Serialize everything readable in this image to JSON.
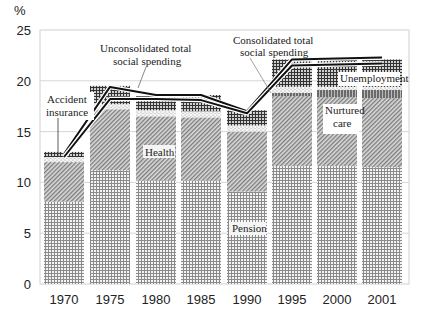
{
  "chart_data": {
    "type": "bar",
    "stacked": true,
    "title": "",
    "ylabel": "%",
    "xlabel": "",
    "ylim": [
      0,
      25
    ],
    "yticks": [
      0,
      5,
      10,
      15,
      20,
      25
    ],
    "grid": "horizontal",
    "categories": [
      "1970",
      "1975",
      "1980",
      "1985",
      "1990",
      "1995",
      "2000",
      "2001"
    ],
    "series": [
      {
        "name": "Pension",
        "pattern": "dense-grid",
        "values": [
          8.1,
          11.2,
          10.2,
          10.2,
          9.1,
          11.6,
          11.6,
          11.5
        ]
      },
      {
        "name": "Health",
        "pattern": "diagonal-hatch",
        "values": [
          3.9,
          6.0,
          6.3,
          6.2,
          5.9,
          6.9,
          6.8,
          6.8
        ]
      },
      {
        "name": "Nurtured care",
        "pattern": "dark-band",
        "values": [
          0,
          0,
          0,
          0,
          0,
          0.3,
          0.7,
          0.8
        ]
      },
      {
        "name": "Accident insurance",
        "pattern": "dots",
        "values": [
          0.5,
          0.5,
          0.6,
          0.6,
          0.6,
          0.6,
          0.3,
          0.3
        ]
      },
      {
        "name": "Unemployment",
        "pattern": "cross-hatch",
        "values": [
          0.5,
          1.8,
          1.4,
          1.6,
          1.5,
          2.7,
          2.7,
          2.7
        ]
      }
    ],
    "lines": [
      {
        "name": "Unconsolidated total social spending",
        "values": [
          12.8,
          19.4,
          18.6,
          18.6,
          17.0,
          22.1,
          22.2,
          22.3
        ]
      },
      {
        "name": "Consolidated total social spending",
        "values": [
          12.5,
          18.2,
          18.2,
          18.1,
          16.8,
          21.5,
          21.6,
          21.7
        ]
      }
    ],
    "annotations": [
      {
        "text": "Accident insurance",
        "lines": [
          "Accident",
          "insurance"
        ]
      },
      {
        "text": "Unconsolidated total social spending",
        "lines": [
          "Unconsolidated total",
          "social spending"
        ]
      },
      {
        "text": "Consolidated total social spending",
        "lines": [
          "Consolidated total",
          "social spending"
        ]
      },
      {
        "text": "Health"
      },
      {
        "text": "Pension"
      },
      {
        "text": "Unemployment"
      },
      {
        "text": "Nurtured care",
        "lines": [
          "Nurtured",
          "care"
        ]
      }
    ]
  },
  "labels": {
    "y_unit": "%",
    "accident_1": "Accident",
    "accident_2": "insurance",
    "uncons_1": "Unconsolidated total",
    "uncons_2": "social spending",
    "cons_1": "Consolidated total",
    "cons_2": "social spending",
    "health": "Health",
    "pension": "Pension",
    "unemployment": "Unemployment",
    "nurtured_1": "Nurtured",
    "nurtured_2": "care"
  }
}
